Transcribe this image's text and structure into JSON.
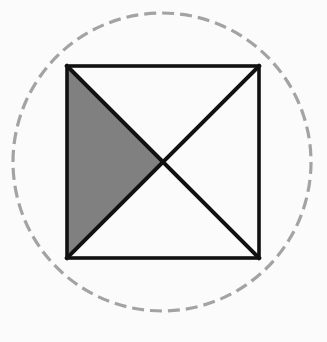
{
  "figure": {
    "title": "Square with diagonals inscribed in a dashed circle",
    "background_color": "#fbfbfb",
    "canvas": {
      "width": 327,
      "height": 342
    },
    "circle": {
      "name": "dashed-circle",
      "center_x": 162,
      "center_y": 162,
      "radius": 149,
      "stroke_color": "#a3a3a3",
      "stroke_width": 3.2,
      "dash_length": 12,
      "dash_gap": 6,
      "fill": "none",
      "style": "dashed"
    },
    "square": {
      "name": "outer-square",
      "left": 67,
      "top": 66,
      "right": 259,
      "bottom": 258,
      "side": 192,
      "stroke_color": "#111111",
      "stroke_width": 3.6,
      "fill": "none"
    },
    "diagonals": [
      {
        "name": "diagonal-tl-br",
        "x1": 67,
        "y1": 66,
        "x2": 259,
        "y2": 258,
        "stroke_color": "#111111",
        "stroke_width": 4
      },
      {
        "name": "diagonal-tr-bl",
        "x1": 259,
        "y1": 66,
        "x2": 67,
        "y2": 258,
        "stroke_color": "#111111",
        "stroke_width": 4
      }
    ],
    "center_point": {
      "x": 163,
      "y": 162
    },
    "shaded_region": {
      "name": "shaded-left-triangle",
      "points": "67,66 163,162 67,258",
      "fill_color": "#808080",
      "quadrant": "left",
      "fraction_of_square": "1/4"
    },
    "unshaded_regions": [
      {
        "name": "top-triangle",
        "points": "67,66 259,66 163,162",
        "fill_color": "#ffffff"
      },
      {
        "name": "right-triangle",
        "points": "259,66 259,258 163,162",
        "fill_color": "#ffffff"
      },
      {
        "name": "bottom-triangle",
        "points": "67,258 259,258 163,162",
        "fill_color": "#ffffff"
      }
    ]
  }
}
